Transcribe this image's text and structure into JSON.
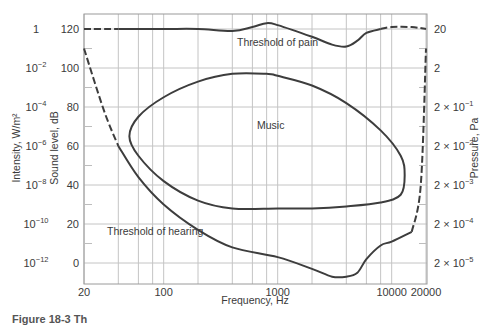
{
  "chart_data": {
    "type": "line",
    "title": "",
    "xlabel": "Frequency, Hz",
    "ylabel": "Sound level, dB",
    "ylabel_left_outer": "Intensity, W/m²",
    "ylabel_right": "Pressure, Pa",
    "xscale": "log",
    "xlim": [
      20,
      20000
    ],
    "ylim": [
      -10,
      128
    ],
    "grid": true,
    "x_ticks": [
      "20",
      "100",
      "1000",
      "10000",
      "20000"
    ],
    "x_gridlines": [
      20,
      40,
      60,
      80,
      100,
      200,
      400,
      600,
      800,
      1000,
      2000,
      4000,
      6000,
      8000,
      10000,
      20000
    ],
    "y_ticks": [
      0,
      20,
      40,
      60,
      80,
      100,
      120
    ],
    "intensity_ticks": [
      {
        "db": 120,
        "base": "1",
        "exp": ""
      },
      {
        "db": 100,
        "base": "10",
        "exp": "−2"
      },
      {
        "db": 80,
        "base": "10",
        "exp": "−4"
      },
      {
        "db": 60,
        "base": "10",
        "exp": "−6"
      },
      {
        "db": 40,
        "base": "10",
        "exp": "−8"
      },
      {
        "db": 20,
        "base": "10",
        "exp": "−10"
      },
      {
        "db": 0,
        "base": "10",
        "exp": "−12"
      }
    ],
    "pressure_ticks": [
      {
        "db": 120,
        "base": "20",
        "exp": ""
      },
      {
        "db": 100,
        "base": "2",
        "exp": ""
      },
      {
        "db": 80,
        "base": "2 × 10",
        "exp": "−1"
      },
      {
        "db": 60,
        "base": "2 × 10",
        "exp": "−2"
      },
      {
        "db": 40,
        "base": "2 × 10",
        "exp": "−3"
      },
      {
        "db": 20,
        "base": "2 × 10",
        "exp": "−4"
      },
      {
        "db": 0,
        "base": "2 × 10",
        "exp": "−5"
      }
    ],
    "annotations": [
      "Threshold of pain",
      "Music",
      "Threshold of hearing"
    ],
    "series": [
      {
        "name": "Threshold of pain",
        "x": [
          20,
          40,
          100,
          200,
          400,
          600,
          800,
          1000,
          2000,
          3000,
          4000,
          5000,
          6000,
          8000,
          10000,
          15000,
          20000
        ],
        "y": [
          120,
          120,
          120,
          120,
          119,
          121,
          123,
          122,
          116,
          112,
          111,
          114,
          118,
          120,
          121,
          121,
          120
        ],
        "dashed_segments": [
          [
            20,
            40
          ],
          [
            8000,
            20000
          ]
        ]
      },
      {
        "name": "Threshold of hearing",
        "x": [
          20,
          30,
          40,
          60,
          100,
          200,
          400,
          1000,
          2000,
          3000,
          4000,
          5000,
          6000,
          8000,
          10000,
          15000,
          18000,
          20000
        ],
        "y": [
          110,
          78,
          60,
          44,
          30,
          17,
          8,
          3,
          -3,
          -7,
          -7,
          -5,
          2,
          9,
          11,
          16,
          40,
          110
        ],
        "dashed_segments": [
          [
            20,
            40
          ],
          [
            15000,
            20000
          ]
        ]
      },
      {
        "name": "Music",
        "closed": true,
        "x": [
          50,
          60,
          100,
          200,
          400,
          800,
          1000,
          2000,
          4000,
          8000,
          12000,
          13000,
          12000,
          8000,
          4000,
          2000,
          1000,
          400,
          200,
          100,
          60,
          50
        ],
        "y": [
          65,
          75,
          85,
          93,
          97,
          97,
          96,
          91,
          82,
          68,
          55,
          45,
          35,
          31,
          29,
          28,
          28,
          28,
          32,
          42,
          55,
          65
        ]
      }
    ]
  },
  "caption": "Figure 18-3  Th"
}
